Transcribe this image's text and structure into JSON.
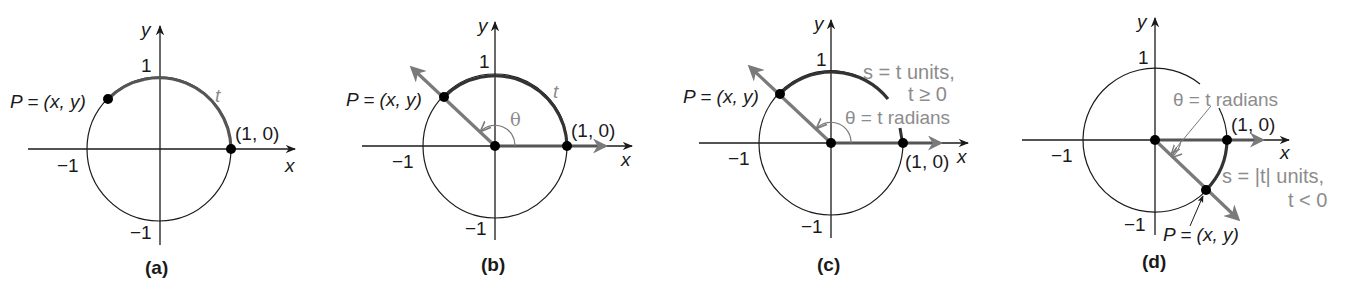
{
  "figure": {
    "panels": [
      {
        "id": "a",
        "caption": "(a)",
        "axis_x": "x",
        "axis_y": "y",
        "tick_pos_y": "1",
        "tick_neg_y": "−1",
        "tick_neg_x": "−1",
        "point_label": "P = (x, y)",
        "start_label": "(1, 0)",
        "arc_label": "t"
      },
      {
        "id": "b",
        "caption": "(b)",
        "axis_x": "x",
        "axis_y": "y",
        "tick_pos_y": "1",
        "tick_neg_y": "−1",
        "tick_neg_x": "−1",
        "point_label": "P = (x, y)",
        "start_label": "(1, 0)",
        "arc_label": "t",
        "angle_label": "θ"
      },
      {
        "id": "c",
        "caption": "(c)",
        "axis_x": "x",
        "axis_y": "y",
        "tick_pos_y": "1",
        "tick_neg_y": "−1",
        "tick_neg_x": "−1",
        "point_label": "P = (x, y)",
        "start_label": "(1, 0)",
        "arc_label_line1": "s = t units,",
        "arc_label_line2": "t ≥ 0",
        "angle_label": "θ = t radians"
      },
      {
        "id": "d",
        "caption": "(d)",
        "axis_x": "x",
        "axis_y": "y",
        "tick_pos_y": "1",
        "tick_neg_y": "−1",
        "tick_neg_x": "−1",
        "point_label": "P = (x, y)",
        "start_label": "(1, 0)",
        "arc_label_line1": "s = |t| units,",
        "arc_label_line2": "t < 0",
        "angle_label": "θ = t radians"
      }
    ],
    "colors": {
      "ink": "#1a1a1a",
      "ray_gray": "#7a7a7a",
      "label_gray": "#8c8c8c"
    }
  }
}
